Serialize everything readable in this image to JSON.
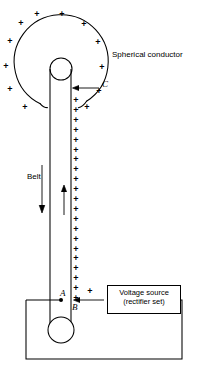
{
  "figure": {
    "width": 197,
    "height": 381,
    "stroke_color": "#000000",
    "background_color": "#ffffff"
  },
  "labels": {
    "spherical_conductor": "Spherical conductor",
    "belt": "Belt",
    "point_c": "C",
    "point_a": "A",
    "point_b": "B",
    "voltage_source_line1": "Voltage source",
    "voltage_source_line2": "(rectifier set)",
    "plus_sign": "+"
  },
  "charges": {
    "sphere_plus_positions": [
      {
        "x": 37,
        "y": 14
      },
      {
        "x": 62,
        "y": 14
      },
      {
        "x": 21,
        "y": 22
      },
      {
        "x": 84,
        "y": 23
      },
      {
        "x": 10,
        "y": 40
      },
      {
        "x": 98,
        "y": 41
      },
      {
        "x": 5,
        "y": 65
      },
      {
        "x": 102,
        "y": 66
      },
      {
        "x": 9,
        "y": 88
      },
      {
        "x": 99,
        "y": 90
      },
      {
        "x": 24,
        "y": 106
      },
      {
        "x": 87,
        "y": 106
      }
    ],
    "belt_plus_top_y": 100,
    "belt_plus_bottom_y": 298,
    "belt_plus_count": 21,
    "belt_plus_x": 76,
    "source_plus": {
      "x": 90,
      "y": 290
    }
  },
  "geometry": {
    "sphere_center": {
      "x": 62,
      "y": 60
    },
    "sphere_radius": 47,
    "top_pulley": {
      "cx": 61,
      "cy": 69,
      "r": 11
    },
    "bottom_pulley": {
      "cx": 61,
      "cy": 330,
      "r": 13
    },
    "belt_left_x": 50,
    "belt_right_x": 71,
    "belt_top_y": 69,
    "belt_bottom_y": 330,
    "down_arrow_x": 42,
    "down_arrow_top": 165,
    "down_arrow_bottom": 213,
    "up_arrow_x": 64,
    "up_arrow_top": 185,
    "up_arrow_bottom": 215,
    "circuit_left_x": 26,
    "circuit_right_x": 182,
    "circuit_bottom_y": 359,
    "node_a": {
      "x": 61,
      "y": 300
    }
  }
}
